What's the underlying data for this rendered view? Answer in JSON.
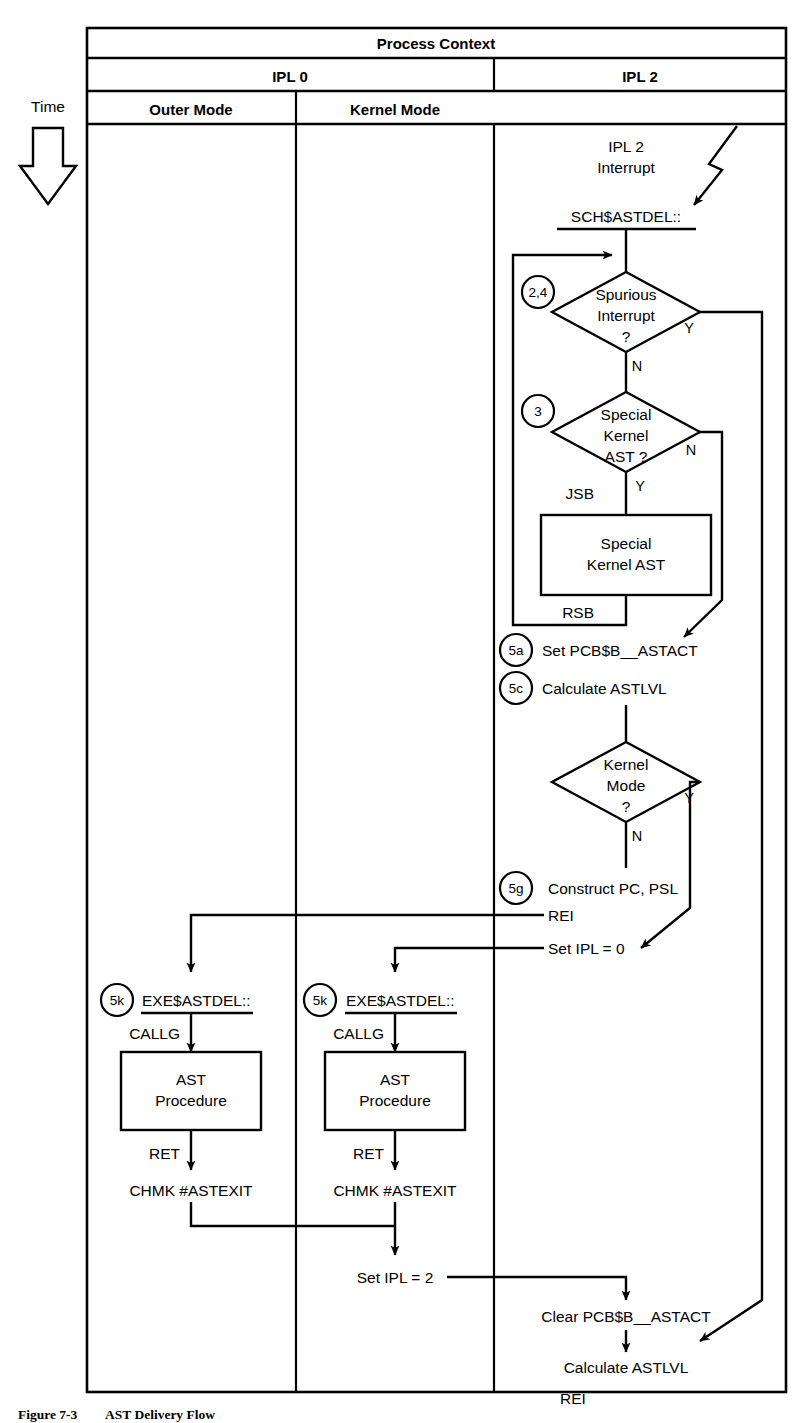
{
  "figure": {
    "caption_number": "Figure 7-3",
    "caption_title": "AST Delivery Flow"
  },
  "axis": {
    "time_label": "Time",
    "time_arrow_icon": "down-arrow-icon"
  },
  "header": {
    "title": "Process Context",
    "ipl_columns": [
      {
        "label": "IPL 0"
      },
      {
        "label": "IPL 2"
      }
    ],
    "mode_columns": [
      {
        "label": "Outer Mode"
      },
      {
        "label": "Kernel Mode"
      }
    ]
  },
  "ipl2": {
    "interrupt_label_line1": "IPL 2",
    "interrupt_label_line2": "Interrupt",
    "entry_point": "SCH$ASTDEL::",
    "decision_spurious": {
      "step": "2,4",
      "line1": "Spurious",
      "line2": "Interrupt",
      "line3": "?",
      "yes": "Y",
      "no": "N"
    },
    "decision_special_kernel": {
      "step": "3",
      "line1": "Special",
      "line2": "Kernel",
      "line3": "AST ?",
      "yes": "Y",
      "no": "N"
    },
    "call_in": "JSB",
    "call_out": "RSB",
    "special_kernel_box": {
      "line1": "Special",
      "line2": "Kernel AST"
    },
    "set_astact": {
      "step": "5a",
      "text": "Set PCB$B__ASTACT"
    },
    "calc_astlvl": {
      "step": "5c",
      "text": "Calculate ASTLVL"
    },
    "decision_kernel_mode": {
      "line1": "Kernel",
      "line2": "Mode",
      "line3": "?",
      "yes": "Y",
      "no": "N"
    },
    "construct": {
      "step": "5g",
      "text": "Construct PC, PSL"
    },
    "rei_label": "REI",
    "set_ipl0": "Set IPL = 0",
    "set_ipl2": "Set IPL = 2",
    "clear_astact": "Clear PCB$B__ASTACT",
    "final_calc_astlvl": "Calculate ASTLVL",
    "final_rei": "REI"
  },
  "outer_mode_flow": {
    "step": "5k",
    "entry_point": "EXE$ASTDEL::",
    "callg": "CALLG",
    "procedure_line1": "AST",
    "procedure_line2": "Procedure",
    "ret": "RET",
    "chmk": "CHMK #ASTEXIT"
  },
  "kernel_mode_flow": {
    "step": "5k",
    "entry_point": "EXE$ASTDEL::",
    "callg": "CALLG",
    "procedure_line1": "AST",
    "procedure_line2": "Procedure",
    "ret": "RET",
    "chmk": "CHMK #ASTEXIT"
  },
  "colors": {
    "ink": "#000000",
    "paper": "#ffffff"
  }
}
